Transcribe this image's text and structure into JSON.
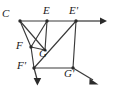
{
  "figure": {
    "type": "line-diagram",
    "background_color": "#ffffff",
    "stroke_color": "#3a3a3a",
    "label_color": "#1a1a1a"
  },
  "vertices": [
    {
      "id": "C",
      "label": "C",
      "x": 20,
      "y": 21,
      "label_x": 3,
      "label_y": 9,
      "dot": true
    },
    {
      "id": "E",
      "label": "E",
      "x": 47,
      "y": 21,
      "label_x": 43,
      "label_y": 6,
      "dot": true
    },
    {
      "id": "Ep",
      "label": "E'",
      "x": 76,
      "y": 21,
      "label_x": 70,
      "label_y": 6,
      "dot": true
    },
    {
      "id": "F",
      "label": "F",
      "x": 31,
      "y": 47,
      "label_x": 17,
      "label_y": 41,
      "dot": true
    },
    {
      "id": "G",
      "label": "G",
      "x": 45,
      "y": 50,
      "label_x": 40,
      "label_y": 48,
      "dot": true
    },
    {
      "id": "Fp",
      "label": "F'",
      "x": 34,
      "y": 68,
      "label_x": 18,
      "label_y": 61,
      "dot": true
    },
    {
      "id": "Gp",
      "label": "G'",
      "x": 73,
      "y": 68,
      "label_x": 65,
      "label_y": 68,
      "dot": true
    }
  ],
  "edges": [
    {
      "name": "C-E",
      "from": "C",
      "to": "E"
    },
    {
      "name": "E-Ep",
      "from": "E",
      "to": "Ep"
    },
    {
      "name": "C-F",
      "from": "C",
      "to": "F"
    },
    {
      "name": "C-G",
      "from": "C",
      "to": "G"
    },
    {
      "name": "E-F",
      "from": "E",
      "to": "F"
    },
    {
      "name": "E-G",
      "from": "E",
      "to": "G"
    },
    {
      "name": "F-G",
      "from": "F",
      "to": "G"
    },
    {
      "name": "F-Fp",
      "from": "F",
      "to": "Fp"
    },
    {
      "name": "Fp-Gp",
      "from": "Fp",
      "to": "Gp"
    },
    {
      "name": "Ep-Gp",
      "from": "Ep",
      "to": "Gp"
    },
    {
      "name": "Ep-Fp",
      "from": "Ep",
      "to": "Fp"
    }
  ],
  "rays": [
    {
      "name": "ray-right",
      "from": "Ep",
      "to_x": 106,
      "to_y": 21
    },
    {
      "name": "ray-down-left",
      "from": "Fp",
      "to_x": 38,
      "to_y": 84
    },
    {
      "name": "ray-down-right",
      "from": "Gp",
      "to_x": 98,
      "to_y": 84
    }
  ],
  "labels": {
    "C": "C",
    "E": "E",
    "E_prime": "E'",
    "F": "F",
    "G": "G",
    "F_prime": "F'",
    "G_prime": "G'"
  }
}
